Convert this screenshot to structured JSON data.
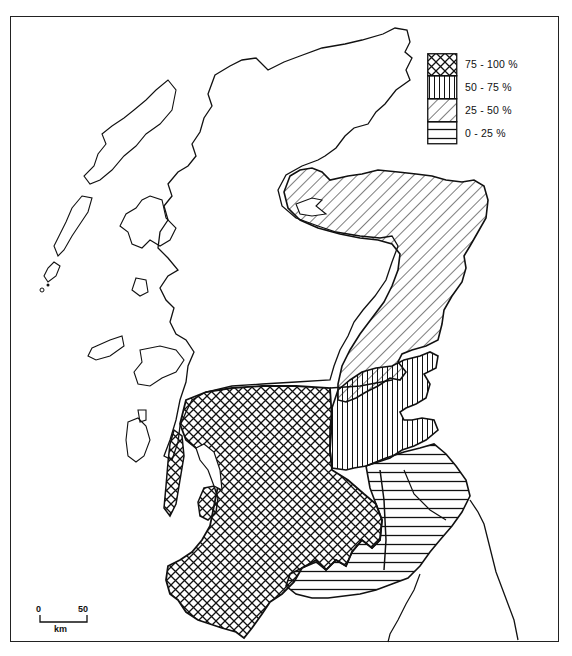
{
  "figure": {
    "frame": true
  },
  "legend": {
    "items": [
      {
        "label": "75 - 100 %",
        "pattern": "crosshatch",
        "pattern_id": "pat-crosshatch"
      },
      {
        "label": "50 - 75 %",
        "pattern": "vertical-lines",
        "pattern_id": "pat-vertical"
      },
      {
        "label": "25 - 50 %",
        "pattern": "diagonal-lines",
        "pattern_id": "pat-diagonal"
      },
      {
        "label": "0 - 25 %",
        "pattern": "horizontal-lines",
        "pattern_id": "pat-horizontal"
      }
    ]
  },
  "scale_bar": {
    "start_label": "0",
    "end_label": "50",
    "unit_label": "km"
  },
  "regions": [
    {
      "name": "north-east-caithness-moray",
      "class": "25 - 50 %"
    },
    {
      "name": "east-tayside-fife",
      "class": "50 - 75 %"
    },
    {
      "name": "central-belt-south-west",
      "class": "75 - 100 %"
    },
    {
      "name": "borders-south-east",
      "class": "0 - 25 %"
    }
  ],
  "colors": {
    "ink": "#111111",
    "paper": "#ffffff"
  }
}
